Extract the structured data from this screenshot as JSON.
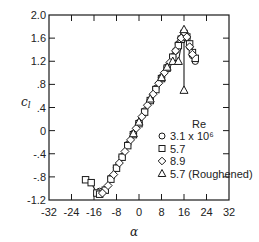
{
  "chart_data": {
    "type": "scatter",
    "title": "",
    "xlabel": "α",
    "ylabel": "c_l",
    "xlim": [
      -32,
      32
    ],
    "ylim": [
      -1.2,
      2.0
    ],
    "xticks": [
      -32,
      -24,
      -16,
      -8,
      0,
      8,
      16,
      24,
      32
    ],
    "xtick_labels": [
      "-32",
      "-24",
      "-16",
      "-8",
      "0",
      "8",
      "16",
      "24",
      "32"
    ],
    "yticks": [
      -1.2,
      -0.8,
      -0.4,
      0,
      0.4,
      0.8,
      1.2,
      1.6,
      2.0
    ],
    "ytick_labels": [
      "-1.2",
      "-.8",
      "-.4",
      "0",
      ".4",
      ".8",
      "1.2",
      "1.6",
      "2.0"
    ],
    "grid": false,
    "legend": {
      "title": "Re",
      "position": "lower right (inside)",
      "entries": [
        {
          "marker": "circle",
          "label": "3.1 x 10⁶"
        },
        {
          "marker": "square",
          "label": "5.7"
        },
        {
          "marker": "diamond",
          "label": "8.9"
        },
        {
          "marker": "triangle",
          "label": "5.7  (Roughened)"
        }
      ]
    },
    "series": [
      {
        "name": "3.1 x 10^6",
        "marker": "circle",
        "x": [
          -14,
          -12,
          -10,
          -8,
          -6,
          -4,
          -2,
          0,
          2,
          4,
          6,
          8,
          10,
          12,
          13,
          14,
          15,
          16,
          17,
          18,
          19,
          20
        ],
        "y": [
          -1.05,
          -1.02,
          -0.82,
          -0.64,
          -0.45,
          -0.24,
          -0.05,
          0.14,
          0.34,
          0.53,
          0.73,
          0.92,
          1.1,
          1.28,
          1.38,
          1.5,
          1.6,
          1.65,
          1.6,
          1.45,
          1.3,
          1.2
        ]
      },
      {
        "name": "5.7",
        "marker": "square",
        "x": [
          -19,
          -17,
          -15,
          -14,
          -12,
          -10,
          -8,
          -6,
          -4,
          -2,
          0,
          2,
          4,
          6,
          8,
          10,
          12,
          14,
          15,
          16,
          17,
          18,
          19,
          20
        ],
        "y": [
          -0.85,
          -0.9,
          -1.08,
          -1.1,
          -1.03,
          -0.84,
          -0.65,
          -0.46,
          -0.26,
          -0.07,
          0.12,
          0.32,
          0.52,
          0.71,
          0.9,
          1.08,
          1.27,
          1.47,
          1.58,
          1.68,
          1.62,
          1.5,
          1.35,
          1.25
        ]
      },
      {
        "name": "8.9",
        "marker": "diamond",
        "x": [
          -13,
          -11,
          -9,
          -7,
          -5,
          -3,
          -1,
          1,
          3,
          5,
          7,
          9,
          11,
          13,
          15,
          16,
          17,
          18,
          19
        ],
        "y": [
          -1.08,
          -0.95,
          -0.76,
          -0.56,
          -0.36,
          -0.16,
          0.04,
          0.24,
          0.44,
          0.63,
          0.82,
          1.0,
          1.18,
          1.38,
          1.6,
          1.7,
          1.62,
          1.45,
          1.32
        ]
      },
      {
        "name": "5.7 (Roughened)",
        "marker": "triangle",
        "x": [
          -2,
          0,
          4,
          8,
          10,
          12,
          14,
          16,
          16
        ],
        "y": [
          -0.05,
          0.15,
          0.55,
          0.92,
          1.1,
          1.2,
          1.2,
          1.75,
          0.7
        ]
      }
    ]
  }
}
